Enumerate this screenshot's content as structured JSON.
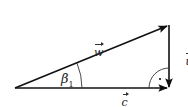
{
  "diagram": {
    "type": "vector-triangle",
    "labels": {
      "w": "w",
      "u": "u",
      "c": "c",
      "angle": "β",
      "angle_sub": "1"
    },
    "vectors": [
      {
        "name": "w",
        "from": "left-vertex",
        "to": "top-right-vertex"
      },
      {
        "name": "u",
        "from": "top-right-vertex",
        "to": "bottom-right-vertex"
      },
      {
        "name": "c",
        "from": "left-vertex",
        "to": "bottom-right-vertex"
      }
    ],
    "right_angle_marker": "bottom-right-vertex",
    "angle_marker": "left-vertex",
    "colors": {
      "stroke": "#111111",
      "text": "#222222",
      "background": "#ffffff"
    }
  }
}
